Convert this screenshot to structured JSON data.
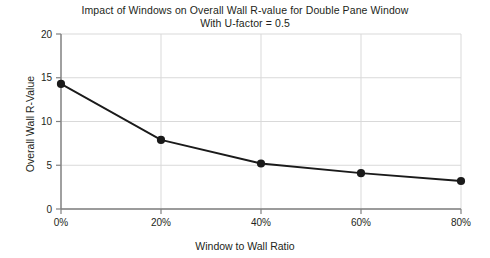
{
  "chart_data": {
    "type": "line",
    "title": "Impact of Windows on Overall Wall R-value for Double Pane Window",
    "subtitle": "With U-factor = 0.5",
    "xlabel": "Window to Wall Ratio",
    "ylabel": "Overall Wall R-Value",
    "x": [
      0,
      20,
      40,
      60,
      80
    ],
    "xtick_labels": [
      "0%",
      "20%",
      "40%",
      "60%",
      "80%"
    ],
    "values": [
      14.3,
      7.9,
      5.2,
      4.1,
      3.2
    ],
    "ytick_labels": [
      "0",
      "5",
      "10",
      "15",
      "20"
    ],
    "yticks": [
      0,
      5,
      10,
      15,
      20
    ],
    "xlim": [
      0,
      80
    ],
    "ylim": [
      0,
      20
    ],
    "grid": true,
    "legend": "none",
    "series_color": "#1a1a1a",
    "grid_color": "#d9d9d9",
    "axis_color": "#808080",
    "marker": "circle",
    "marker_size": 7
  }
}
